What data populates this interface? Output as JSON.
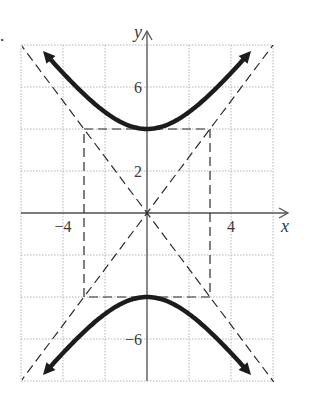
{
  "problem": {
    "number_label": "."
  },
  "chart_data": {
    "type": "line",
    "title": "",
    "xlabel": "x",
    "ylabel": "y",
    "xlim": [
      -6,
      6
    ],
    "ylim": [
      -8,
      8
    ],
    "grid": true,
    "grid_step": 2,
    "x_tick_labels": [
      {
        "value": -4,
        "text": "−4"
      },
      {
        "value": 4,
        "text": "4"
      }
    ],
    "y_tick_labels": [
      {
        "value": 6,
        "text": "6"
      },
      {
        "value": 2,
        "text": "2"
      },
      {
        "value": -6,
        "text": "−6"
      }
    ],
    "equation": "y^2/16 - x^2/9 = 1",
    "series": [
      {
        "name": "hyperbola upper branch",
        "style": "solid-thick-arrows",
        "vertex": [
          0,
          4
        ],
        "x_range": [
          -4.7,
          4.7
        ]
      },
      {
        "name": "hyperbola lower branch",
        "style": "solid-thick-arrows",
        "vertex": [
          0,
          -4
        ],
        "x_range": [
          -4.7,
          4.7
        ]
      },
      {
        "name": "asymptote",
        "style": "dashed",
        "equation": "y = (4/3)x"
      },
      {
        "name": "asymptote",
        "style": "dashed",
        "equation": "y = -(4/3)x"
      },
      {
        "name": "central rectangle",
        "style": "dashed",
        "corners": [
          [
            -3,
            4
          ],
          [
            3,
            4
          ],
          [
            3,
            -4
          ],
          [
            -3,
            -4
          ]
        ]
      }
    ]
  }
}
